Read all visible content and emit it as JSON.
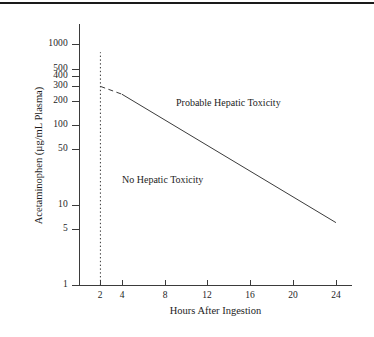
{
  "figure": {
    "top_rule": "horizontal-rule",
    "background_color": "#ffffff",
    "line_color": "#3b3b3b",
    "text_color": "#1d1d1d"
  },
  "chart_data": {
    "type": "line",
    "title": "",
    "subtitle": "",
    "xlabel": "Hours After Ingestion",
    "ylabel": "Acetaminophen (µg/mL Plasma)",
    "xscale": "linear",
    "yscale": "log",
    "xlim": [
      0,
      25.5
    ],
    "ylim": [
      1,
      1800
    ],
    "grid": false,
    "legend": null,
    "xticks": [
      2,
      4,
      8,
      12,
      16,
      20,
      24
    ],
    "xticklabels": [
      "2",
      "4",
      "8",
      "12",
      "16",
      "20",
      "24"
    ],
    "yticks": [
      1,
      5,
      10,
      50,
      100,
      200,
      300,
      400,
      500,
      1000
    ],
    "yticklabels": [
      "1",
      "5",
      "10",
      "50",
      "100",
      "200",
      "300",
      "400",
      "500",
      "1000"
    ],
    "series": [
      {
        "name": "treatment-line-dashed-segment",
        "style": "dashed",
        "x": [
          2,
          4
        ],
        "y": [
          300,
          240
        ]
      },
      {
        "name": "treatment-line-solid-segment",
        "style": "solid",
        "x": [
          4,
          24
        ],
        "y": [
          240,
          6
        ]
      },
      {
        "name": "four-hour-reference-line",
        "style": "dotted",
        "orientation": "vertical",
        "x": [
          2,
          2
        ],
        "y": [
          1,
          800
        ]
      }
    ],
    "annotations": [
      {
        "name": "probable-hepatic-toxicity",
        "text": "Probable Hepatic Toxicity",
        "x": 12.5,
        "y": 330
      },
      {
        "name": "no-hepatic-toxicity",
        "text": "No Hepatic Toxicity",
        "x": 7.0,
        "y": 32
      }
    ]
  },
  "axis": {
    "x_title": "Hours After Ingestion",
    "y_title": "Acetaminophen (µg/mL Plasma)",
    "x_tick_labels": [
      "2",
      "4",
      "8",
      "12",
      "16",
      "20",
      "24"
    ],
    "y_tick_labels": [
      "1000",
      "500",
      "400",
      "300",
      "200",
      "100",
      "50",
      "10",
      "5",
      "1"
    ]
  },
  "labels": {
    "probable": "Probable Hepatic Toxicity",
    "no_toxicity": "No Hepatic Toxicity"
  }
}
